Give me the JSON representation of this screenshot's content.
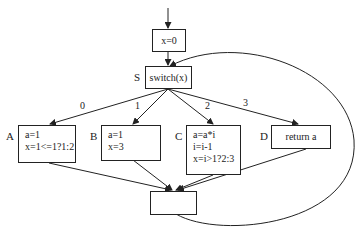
{
  "diagram": {
    "entry": {
      "text": "x=0"
    },
    "switch": {
      "label": "S",
      "text": "switch(x)"
    },
    "cases": [
      {
        "edge": "0",
        "label": "A",
        "lines": [
          "a=1",
          "x=1<=1?1:2"
        ]
      },
      {
        "edge": "1",
        "label": "B",
        "lines": [
          "a=1",
          "x=3"
        ]
      },
      {
        "edge": "2",
        "label": "C",
        "lines": [
          "a=a*i",
          "i=i-1",
          "x=i>1?2:3"
        ]
      },
      {
        "edge": "3",
        "label": "D",
        "lines": [
          "return a"
        ]
      }
    ],
    "join": {
      "text": ""
    },
    "colors": {
      "stroke": "#222222",
      "background": "#ffffff"
    }
  }
}
